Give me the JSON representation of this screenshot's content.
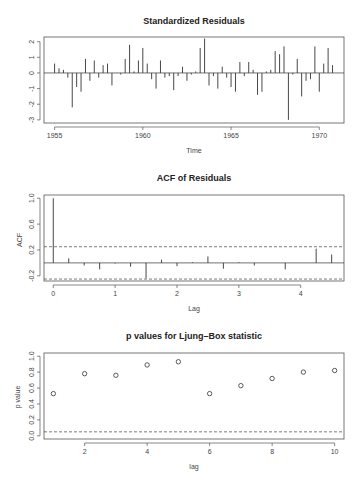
{
  "chart_data": [
    {
      "type": "bar",
      "title": "Standardized Residuals",
      "xlabel": "Time",
      "ylabel": "",
      "xlim": [
        1954.4,
        1971.4
      ],
      "ylim": [
        -3.2,
        2.3
      ],
      "x_ticks": [
        1955,
        1960,
        1965,
        1970
      ],
      "y_ticks": [
        -3,
        -2,
        -1,
        0,
        1,
        2
      ],
      "grid": false,
      "x": [
        1955.0,
        1955.25,
        1955.5,
        1955.75,
        1956.0,
        1956.25,
        1956.5,
        1956.75,
        1957.0,
        1957.25,
        1957.5,
        1957.75,
        1958.0,
        1958.25,
        1958.5,
        1958.75,
        1959.0,
        1959.25,
        1959.5,
        1959.75,
        1960.0,
        1960.25,
        1960.5,
        1960.75,
        1961.0,
        1961.25,
        1961.5,
        1961.75,
        1962.0,
        1962.25,
        1962.5,
        1962.75,
        1963.0,
        1963.25,
        1963.5,
        1963.75,
        1964.0,
        1964.25,
        1964.5,
        1964.75,
        1965.0,
        1965.25,
        1965.5,
        1965.75,
        1966.0,
        1966.25,
        1966.5,
        1966.75,
        1967.0,
        1967.25,
        1967.5,
        1967.75,
        1968.0,
        1968.25,
        1968.5,
        1968.75,
        1969.0,
        1969.25,
        1969.5,
        1969.75,
        1970.0,
        1970.25,
        1970.5,
        1970.75
      ],
      "values": [
        0.6,
        0.3,
        0.2,
        -0.3,
        -2.2,
        -0.9,
        -1.2,
        0.9,
        -0.5,
        0.8,
        -0.3,
        0.5,
        0.6,
        -0.8,
        0.0,
        -0.1,
        0.9,
        1.8,
        0.1,
        0.8,
        1.6,
        0.6,
        -0.4,
        -1.0,
        0.8,
        -0.3,
        -0.2,
        -1.1,
        -0.2,
        0.4,
        -0.5,
        -0.1,
        0.1,
        1.6,
        2.2,
        -0.8,
        -0.2,
        -1.0,
        0.4,
        -0.3,
        -0.9,
        -1.2,
        0.7,
        -0.2,
        0.7,
        0.2,
        -1.4,
        -1.2,
        0.1,
        0.2,
        1.4,
        1.2,
        1.7,
        -3.0,
        -0.1,
        0.9,
        -1.5,
        -0.5,
        -0.4,
        1.7,
        -1.2,
        0.6,
        1.6,
        0.5
      ]
    },
    {
      "type": "bar",
      "title": "ACF of Residuals",
      "xlabel": "Lag",
      "ylabel": "ACF",
      "xlim": [
        -0.15,
        4.7
      ],
      "ylim": [
        -0.28,
        1.05
      ],
      "x_ticks": [
        0,
        1,
        2,
        3,
        4
      ],
      "y_ticks": [
        -0.2,
        0.2,
        0.6,
        1.0
      ],
      "conf_bounds": [
        0.25,
        -0.25
      ],
      "x": [
        0,
        0.25,
        0.5,
        0.75,
        1.0,
        1.25,
        1.5,
        1.75,
        2.0,
        2.25,
        2.5,
        2.75,
        3.0,
        3.25,
        3.5,
        3.75,
        4.0,
        4.25,
        4.5
      ],
      "values": [
        1.0,
        0.07,
        -0.04,
        -0.1,
        -0.01,
        -0.06,
        -0.24,
        0.05,
        -0.05,
        0.01,
        0.1,
        -0.09,
        0.01,
        -0.04,
        0.0,
        -0.1,
        0.0,
        0.22,
        0.13
      ]
    },
    {
      "type": "scatter",
      "title": "p values for Ljung–Box statistic",
      "xlabel": "lag",
      "ylabel": "p value",
      "xlim": [
        0.7,
        10.3
      ],
      "ylim": [
        -0.04,
        1.04
      ],
      "x_ticks": [
        2,
        4,
        6,
        8,
        10
      ],
      "y_ticks": [
        0.0,
        0.2,
        0.4,
        0.6,
        0.8,
        1.0
      ],
      "threshold": 0.05,
      "x": [
        1,
        2,
        3,
        4,
        5,
        6,
        7,
        8,
        9,
        10
      ],
      "values": [
        0.53,
        0.78,
        0.76,
        0.89,
        0.93,
        0.53,
        0.63,
        0.72,
        0.8,
        0.82
      ]
    }
  ],
  "labels": {
    "p1_title": "Standardized Residuals",
    "p1_xlabel": "Time",
    "p2_title": "ACF of Residuals",
    "p2_xlabel": "Lag",
    "p2_ylabel": "ACF",
    "p3_title": "p values for Ljung–Box statistic",
    "p3_xlabel": "lag",
    "p3_ylabel": "p value"
  }
}
